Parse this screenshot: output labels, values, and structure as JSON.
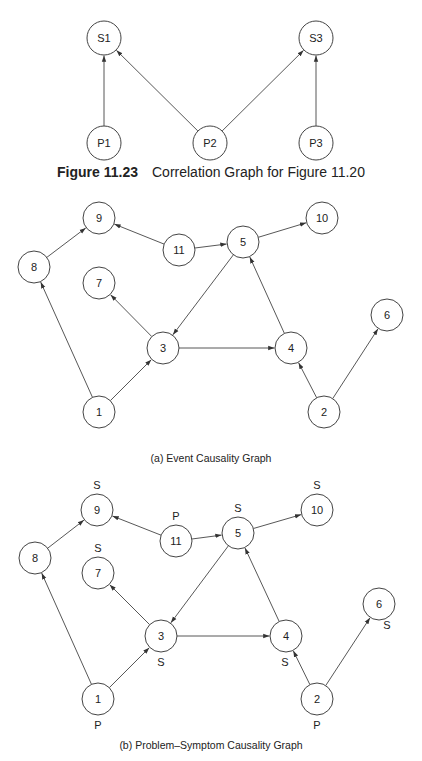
{
  "figure_23": {
    "number": "Figure 11.23",
    "title": "Correlation Graph for Figure 11.20",
    "nodes": [
      {
        "id": "S1",
        "label": "S1"
      },
      {
        "id": "S3",
        "label": "S3"
      },
      {
        "id": "P1",
        "label": "P1"
      },
      {
        "id": "P2",
        "label": "P2"
      },
      {
        "id": "P3",
        "label": "P3"
      }
    ],
    "edges": [
      {
        "from": "P1",
        "to": "S1"
      },
      {
        "from": "P2",
        "to": "S1"
      },
      {
        "from": "P2",
        "to": "S3"
      },
      {
        "from": "P3",
        "to": "S3"
      }
    ]
  },
  "graph_a": {
    "caption": "(a) Event Causality Graph",
    "nodes": [
      {
        "id": "1",
        "label": "1"
      },
      {
        "id": "2",
        "label": "2"
      },
      {
        "id": "3",
        "label": "3"
      },
      {
        "id": "4",
        "label": "4"
      },
      {
        "id": "5",
        "label": "5"
      },
      {
        "id": "6",
        "label": "6"
      },
      {
        "id": "7",
        "label": "7"
      },
      {
        "id": "8",
        "label": "8"
      },
      {
        "id": "9",
        "label": "9"
      },
      {
        "id": "10",
        "label": "10"
      },
      {
        "id": "11",
        "label": "11"
      }
    ],
    "edges": [
      {
        "from": "8",
        "to": "9"
      },
      {
        "from": "11",
        "to": "9"
      },
      {
        "from": "11",
        "to": "5"
      },
      {
        "from": "5",
        "to": "10"
      },
      {
        "from": "5",
        "to": "3"
      },
      {
        "from": "4",
        "to": "5"
      },
      {
        "from": "3",
        "to": "7"
      },
      {
        "from": "3",
        "to": "4"
      },
      {
        "from": "1",
        "to": "8"
      },
      {
        "from": "1",
        "to": "3"
      },
      {
        "from": "2",
        "to": "4"
      },
      {
        "from": "2",
        "to": "6"
      }
    ]
  },
  "graph_b": {
    "caption": "(b) Problem–Symptom Causality Graph",
    "nodes": [
      {
        "id": "1",
        "label": "1",
        "tag": "P"
      },
      {
        "id": "2",
        "label": "2",
        "tag": "P"
      },
      {
        "id": "3",
        "label": "3",
        "tag": "S"
      },
      {
        "id": "4",
        "label": "4",
        "tag": "S"
      },
      {
        "id": "5",
        "label": "5",
        "tag": "S"
      },
      {
        "id": "6",
        "label": "6",
        "tag": "S"
      },
      {
        "id": "7",
        "label": "7",
        "tag": "S"
      },
      {
        "id": "8",
        "label": "8",
        "tag": ""
      },
      {
        "id": "9",
        "label": "9",
        "tag": "S"
      },
      {
        "id": "10",
        "label": "10",
        "tag": "S"
      },
      {
        "id": "11",
        "label": "11",
        "tag": "P"
      }
    ],
    "edges": [
      {
        "from": "8",
        "to": "9"
      },
      {
        "from": "11",
        "to": "9"
      },
      {
        "from": "11",
        "to": "5"
      },
      {
        "from": "5",
        "to": "10"
      },
      {
        "from": "5",
        "to": "3"
      },
      {
        "from": "4",
        "to": "5"
      },
      {
        "from": "3",
        "to": "7"
      },
      {
        "from": "3",
        "to": "4"
      },
      {
        "from": "1",
        "to": "8"
      },
      {
        "from": "1",
        "to": "3"
      },
      {
        "from": "2",
        "to": "4"
      },
      {
        "from": "2",
        "to": "6"
      }
    ]
  }
}
